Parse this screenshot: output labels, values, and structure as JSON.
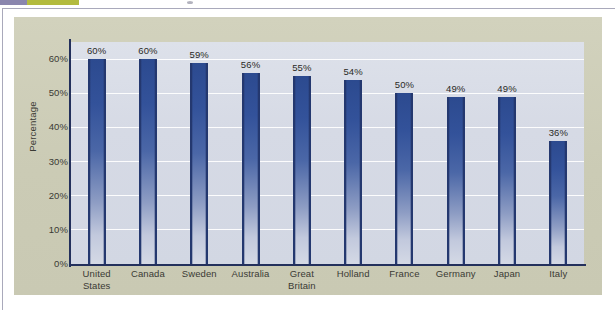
{
  "page": {
    "background_color": "#ffffff",
    "panel_color": "#cfcfba",
    "plot_background_color": "#d9dde7",
    "accent_color": "#2c4a8f",
    "axis_color": "#23305c",
    "gridline_color": "#ffffff"
  },
  "top_strip": {
    "segment_purple_color": "#8a86ae",
    "segment_olive_color": "#b3bb3f",
    "dot_color": "#9a9aa8"
  },
  "chart_data": {
    "type": "bar",
    "title": "",
    "subtitle": "",
    "xlabel": "",
    "ylabel": "Percentage",
    "ylim": [
      0,
      65
    ],
    "grid": true,
    "legend": false,
    "legend_position": "none",
    "y_ticks": [
      "0%",
      "10%",
      "20%",
      "30%",
      "40%",
      "50%",
      "60%"
    ],
    "y_tick_values": [
      0,
      10,
      20,
      30,
      40,
      50,
      60
    ],
    "categories": [
      "United States",
      "Canada",
      "Sweden",
      "Australia",
      "Great Britain",
      "Holland",
      "France",
      "Germany",
      "Japan",
      "Italy"
    ],
    "category_lines": [
      [
        "United",
        "States"
      ],
      [
        "Canada"
      ],
      [
        "Sweden"
      ],
      [
        "Australia"
      ],
      [
        "Great",
        "Britain"
      ],
      [
        "Holland"
      ],
      [
        "France"
      ],
      [
        "Germany"
      ],
      [
        "Japan"
      ],
      [
        "Italy"
      ]
    ],
    "values": [
      60,
      60,
      59,
      56,
      55,
      54,
      50,
      49,
      49,
      36
    ],
    "data_labels": [
      "60%",
      "60%",
      "59%",
      "56%",
      "55%",
      "54%",
      "50%",
      "49%",
      "49%",
      "36%"
    ],
    "bar_color": "#2c4a8f",
    "bar_gradient": [
      "#2c4a8f",
      "#d4d9e5"
    ]
  }
}
